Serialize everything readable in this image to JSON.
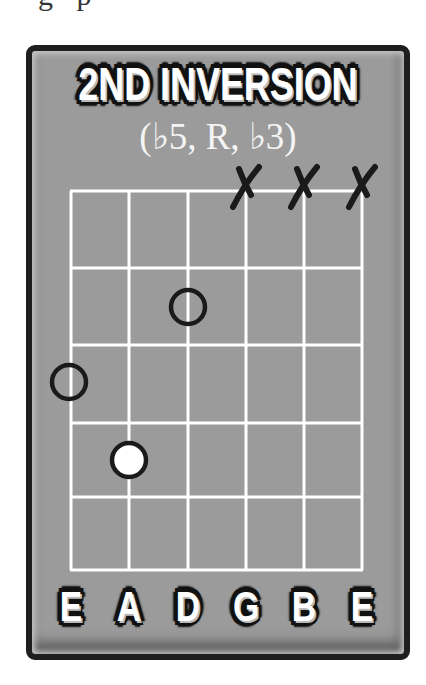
{
  "top_fragment": "g p",
  "card": {
    "title": "2ND INVERSION",
    "subtitle": "(♭5, R, ♭3)",
    "colors": {
      "border": "#1e1e1e",
      "background": "#9b9b9b",
      "grid_lines": "#ffffff",
      "marker_outline": "#1a1a1a",
      "root_fill": "#ffffff",
      "mute_x": "#1a1a1a"
    }
  },
  "fretboard": {
    "strings": [
      "E",
      "A",
      "D",
      "G",
      "B",
      "E"
    ],
    "string_x": [
      71,
      129,
      188,
      246,
      304,
      362
    ],
    "fret_y": [
      191,
      268,
      345,
      423,
      497,
      570
    ],
    "muted_strings": [
      3,
      4,
      5
    ],
    "muted_symbol": "X",
    "notes": [
      {
        "string": 0,
        "string_name": "E",
        "fret": 3,
        "interval": "♭3",
        "type": "open-circle",
        "cx": 69,
        "cy": 382
      },
      {
        "string": 1,
        "string_name": "A",
        "fret": 4,
        "interval": "R",
        "type": "root-filled",
        "cx": 129,
        "cy": 460
      },
      {
        "string": 2,
        "string_name": "D",
        "fret": 2,
        "interval": "♭5",
        "type": "open-circle",
        "cx": 188,
        "cy": 307
      }
    ]
  }
}
